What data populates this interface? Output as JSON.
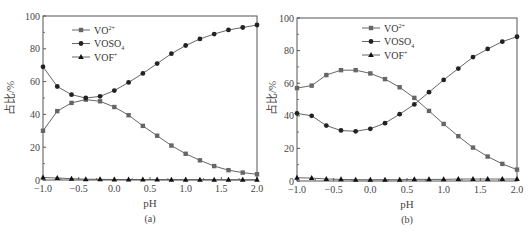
{
  "chart_data": [
    {
      "type": "line",
      "panel": "a",
      "caption": "(a)",
      "title": "",
      "xlabel": "pH",
      "ylabel": "占比/%",
      "xlim": [
        -1.0,
        2.0
      ],
      "ylim": [
        0,
        100
      ],
      "xticks": [
        "-1.0",
        "-0.5",
        "0.0",
        "0.5",
        "1.0",
        "1.5",
        "2.0"
      ],
      "yticks": [
        "0",
        "20",
        "40",
        "60",
        "80",
        "100"
      ],
      "grid": false,
      "legend_position": "upper-left",
      "x": [
        -1.0,
        -0.8,
        -0.6,
        -0.4,
        -0.2,
        0.0,
        0.2,
        0.4,
        0.6,
        0.8,
        1.0,
        1.2,
        1.4,
        1.6,
        1.8,
        2.0
      ],
      "series": [
        {
          "name": "VO2+",
          "label_main": "VO",
          "label_sup": "2+",
          "label_sub": "",
          "marker": "square",
          "values": [
            30,
            42,
            47,
            49,
            48,
            44.5,
            39.5,
            33,
            27,
            21,
            16,
            12,
            8.5,
            6,
            4.5,
            3.5
          ]
        },
        {
          "name": "VOSO4",
          "label_main": "VOSO",
          "label_sup": "",
          "label_sub": "4",
          "marker": "circle",
          "values": [
            69,
            57,
            52,
            50,
            51,
            54.5,
            59.5,
            65,
            71,
            77,
            82,
            86,
            89,
            91.5,
            93,
            94.5
          ]
        },
        {
          "name": "VOF+",
          "label_main": "VOF",
          "label_sup": "+",
          "label_sub": "",
          "marker": "triangle",
          "values": [
            1.5,
            1.2,
            0.8,
            0.5,
            0.4,
            0.3,
            0.3,
            0.3,
            0.3,
            0.2,
            0.2,
            0.2,
            0.2,
            0.1,
            0.1,
            0.1
          ]
        }
      ]
    },
    {
      "type": "line",
      "panel": "b",
      "caption": "(b)",
      "title": "",
      "xlabel": "pH",
      "ylabel": "占比/%",
      "xlim": [
        -1.0,
        2.0
      ],
      "ylim": [
        0,
        100
      ],
      "xticks": [
        "-1.0",
        "-0.5",
        "0.0",
        "0.5",
        "1.0",
        "1.5",
        "2.0"
      ],
      "yticks": [
        "0",
        "20",
        "40",
        "60",
        "80",
        "100"
      ],
      "grid": false,
      "legend_position": "upper-center",
      "x": [
        -1.0,
        -0.8,
        -0.6,
        -0.4,
        -0.2,
        0.0,
        0.2,
        0.4,
        0.6,
        0.8,
        1.0,
        1.2,
        1.4,
        1.6,
        1.8,
        2.0
      ],
      "series": [
        {
          "name": "VO2+",
          "label_main": "VO",
          "label_sup": "2+",
          "label_sub": "",
          "marker": "square",
          "values": [
            57,
            58.5,
            65,
            68,
            68,
            66,
            62.5,
            57.5,
            51,
            43,
            35,
            27.5,
            20.5,
            15,
            10.5,
            7
          ]
        },
        {
          "name": "VOSO4",
          "label_main": "VOSO",
          "label_sup": "",
          "label_sub": "4",
          "marker": "circle",
          "values": [
            41.5,
            40,
            34,
            31,
            30.5,
            32,
            35.5,
            41,
            47,
            54.5,
            62,
            69,
            76,
            81,
            85.5,
            88.5
          ]
        },
        {
          "name": "VOF+",
          "label_main": "VOF",
          "label_sup": "+",
          "label_sub": "",
          "marker": "triangle",
          "values": [
            2,
            1.8,
            1.2,
            1,
            0.8,
            0.8,
            0.8,
            0.8,
            1,
            1,
            1,
            1.2,
            1.2,
            1.2,
            1.2,
            1.2
          ]
        }
      ]
    }
  ],
  "colors": {
    "axis": "#555555",
    "line": "#555555",
    "marker_square": "#666666",
    "marker_circle": "#222222",
    "marker_triangle": "#111111",
    "text": "#444444"
  }
}
